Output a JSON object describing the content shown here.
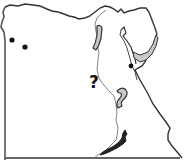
{
  "map": {
    "subject": "Outline map of Egypt",
    "colors": {
      "background": "#ffffff",
      "border": "#333333",
      "border_light": "#777777",
      "river": "#666666",
      "shaded_region": "#c8c8c8",
      "marker": "#111111"
    },
    "markers": [
      {
        "type": "dot",
        "x": 12,
        "y": 40
      },
      {
        "type": "dot",
        "x": 25,
        "y": 47
      },
      {
        "type": "dot",
        "x": 131,
        "y": 66
      }
    ],
    "annotation": {
      "text": "?",
      "x": 96,
      "y": 84
    },
    "shaded_regions": [
      "nile-valley-north-curve",
      "nile-bend-middle",
      "sinai-gulf-region"
    ]
  }
}
